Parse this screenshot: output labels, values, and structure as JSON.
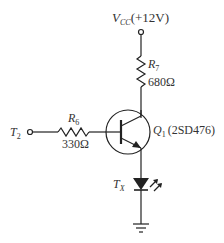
{
  "diagram": {
    "type": "circuit-schematic",
    "colors": {
      "stroke": "#222222",
      "text": "#333333",
      "background": "#ffffff"
    },
    "supply": {
      "symbol": "V",
      "subscript": "CC",
      "value": "(+12V)"
    },
    "input": {
      "symbol": "T",
      "subscript": "2"
    },
    "resistors": [
      {
        "id": "R7",
        "symbol": "R",
        "subscript": "7",
        "value": "680Ω"
      },
      {
        "id": "R6",
        "symbol": "R",
        "subscript": "6",
        "value": "330Ω"
      }
    ],
    "transistor": {
      "symbol": "Q",
      "subscript": "1",
      "part": "(2SD476)",
      "type": "NPN"
    },
    "led": {
      "symbol": "T",
      "subscript": "X"
    },
    "ground": {
      "label": ""
    }
  }
}
